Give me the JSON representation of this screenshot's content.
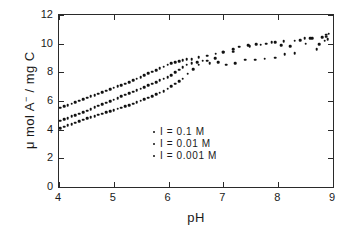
{
  "chart_data": {
    "type": "scatter",
    "title": "",
    "xlabel": "pH",
    "ylabel": "μ mol A− / mg C",
    "ylabel_parts": {
      "prefix": "μ mol  A",
      "superscript": "−",
      "suffix": " / mg C"
    },
    "xlim": [
      4,
      9
    ],
    "ylim": [
      0,
      12
    ],
    "xticks": [
      4,
      5,
      6,
      7,
      8,
      9
    ],
    "yticks": [
      0,
      2,
      4,
      6,
      8,
      10,
      12
    ],
    "xtick_labels": [
      "4",
      "5",
      "6",
      "7",
      "8",
      "9"
    ],
    "ytick_labels": [
      "0",
      "2",
      "4",
      "6",
      "8",
      "10",
      "12"
    ],
    "grid": false,
    "legend_position": "center-right-lower",
    "marker": "dot",
    "marker_color": "#111111",
    "frame_color": "#2a2a2a",
    "background": "#ffffff",
    "series": [
      {
        "name": "I = 0.1 M",
        "label": "I = 0.1 M",
        "ionic_strength": 0.1,
        "points": [
          [
            4.02,
            5.52
          ],
          [
            4.09,
            5.62
          ],
          [
            4.16,
            5.7
          ],
          [
            4.23,
            5.8
          ],
          [
            4.3,
            5.92
          ],
          [
            4.37,
            6.02
          ],
          [
            4.44,
            6.12
          ],
          [
            4.51,
            6.22
          ],
          [
            4.58,
            6.33
          ],
          [
            4.65,
            6.42
          ],
          [
            4.72,
            6.52
          ],
          [
            4.79,
            6.62
          ],
          [
            4.86,
            6.72
          ],
          [
            4.93,
            6.82
          ],
          [
            5.0,
            6.92
          ],
          [
            5.07,
            7.02
          ],
          [
            5.14,
            7.12
          ],
          [
            5.21,
            7.22
          ],
          [
            5.28,
            7.33
          ],
          [
            5.35,
            7.44
          ],
          [
            5.42,
            7.56
          ],
          [
            5.49,
            7.68
          ],
          [
            5.56,
            7.8
          ],
          [
            5.63,
            7.92
          ],
          [
            5.7,
            8.04
          ],
          [
            5.77,
            8.16
          ],
          [
            5.84,
            8.28
          ],
          [
            5.91,
            8.4
          ],
          [
            5.98,
            8.52
          ],
          [
            6.05,
            8.62
          ],
          [
            6.12,
            8.7
          ],
          [
            6.19,
            8.78
          ],
          [
            6.26,
            8.85
          ],
          [
            6.33,
            8.9
          ],
          [
            6.42,
            8.93
          ],
          [
            6.55,
            9.05
          ],
          [
            6.7,
            9.15
          ],
          [
            6.86,
            9.3
          ],
          [
            7.0,
            9.45
          ],
          [
            7.18,
            9.6
          ],
          [
            7.28,
            9.78
          ],
          [
            7.45,
            9.9
          ],
          [
            7.6,
            9.95
          ],
          [
            7.78,
            10.0
          ],
          [
            7.95,
            10.12
          ],
          [
            8.1,
            10.18
          ],
          [
            8.3,
            10.22
          ],
          [
            8.48,
            10.38
          ],
          [
            8.62,
            10.4
          ],
          [
            8.8,
            10.45
          ],
          [
            8.88,
            10.62
          ],
          [
            8.92,
            10.7
          ]
        ]
      },
      {
        "name": "I = 0.01 M",
        "label": "I = 0.01 M",
        "ionic_strength": 0.01,
        "points": [
          [
            4.02,
            4.62
          ],
          [
            4.09,
            4.72
          ],
          [
            4.16,
            4.82
          ],
          [
            4.23,
            4.92
          ],
          [
            4.3,
            5.02
          ],
          [
            4.37,
            5.12
          ],
          [
            4.44,
            5.22
          ],
          [
            4.51,
            5.33
          ],
          [
            4.58,
            5.44
          ],
          [
            4.65,
            5.55
          ],
          [
            4.72,
            5.66
          ],
          [
            4.79,
            5.77
          ],
          [
            4.86,
            5.88
          ],
          [
            4.93,
            5.99
          ],
          [
            5.0,
            6.1
          ],
          [
            5.07,
            6.21
          ],
          [
            5.14,
            6.32
          ],
          [
            5.21,
            6.43
          ],
          [
            5.28,
            6.54
          ],
          [
            5.35,
            6.65
          ],
          [
            5.42,
            6.76
          ],
          [
            5.49,
            6.87
          ],
          [
            5.56,
            6.98
          ],
          [
            5.63,
            7.09
          ],
          [
            5.7,
            7.2
          ],
          [
            5.77,
            7.32
          ],
          [
            5.84,
            7.44
          ],
          [
            5.91,
            7.56
          ],
          [
            5.98,
            7.68
          ],
          [
            6.05,
            7.82
          ],
          [
            6.12,
            8.0
          ],
          [
            6.19,
            8.18
          ],
          [
            6.26,
            8.35
          ],
          [
            6.33,
            8.52
          ],
          [
            6.42,
            8.62
          ],
          [
            6.52,
            8.72
          ],
          [
            6.62,
            8.8
          ],
          [
            6.75,
            8.62
          ],
          [
            6.9,
            8.7
          ],
          [
            7.05,
            8.52
          ],
          [
            7.22,
            8.62
          ],
          [
            7.4,
            8.88
          ],
          [
            7.58,
            8.88
          ],
          [
            7.75,
            8.95
          ],
          [
            7.95,
            9.02
          ],
          [
            8.12,
            9.28
          ],
          [
            8.3,
            9.32
          ],
          [
            8.5,
            10.0
          ],
          [
            8.7,
            9.6
          ],
          [
            8.85,
            10.22
          ],
          [
            8.9,
            10.3
          ]
        ]
      },
      {
        "name": "I = 0.001 M",
        "label": "I = 0.001 M",
        "ionic_strength": 0.001,
        "points": [
          [
            4.02,
            4.12
          ],
          [
            4.09,
            4.2
          ],
          [
            4.16,
            4.3
          ],
          [
            4.23,
            4.4
          ],
          [
            4.3,
            4.5
          ],
          [
            4.37,
            4.6
          ],
          [
            4.44,
            4.7
          ],
          [
            4.51,
            4.8
          ],
          [
            4.58,
            4.88
          ],
          [
            4.65,
            4.96
          ],
          [
            4.72,
            5.04
          ],
          [
            4.79,
            5.12
          ],
          [
            4.86,
            5.2
          ],
          [
            4.93,
            5.28
          ],
          [
            5.0,
            5.36
          ],
          [
            5.07,
            5.45
          ],
          [
            5.14,
            5.54
          ],
          [
            5.21,
            5.63
          ],
          [
            5.28,
            5.72
          ],
          [
            5.35,
            5.82
          ],
          [
            5.42,
            5.92
          ],
          [
            5.49,
            6.02
          ],
          [
            5.56,
            6.12
          ],
          [
            5.63,
            6.22
          ],
          [
            5.7,
            6.34
          ],
          [
            5.77,
            6.46
          ],
          [
            5.84,
            6.58
          ],
          [
            5.91,
            6.7
          ],
          [
            5.98,
            6.86
          ],
          [
            6.05,
            7.02
          ],
          [
            6.12,
            7.2
          ],
          [
            6.19,
            7.38
          ],
          [
            6.26,
            7.56
          ],
          [
            6.35,
            7.9
          ],
          [
            6.45,
            8.22
          ],
          [
            6.55,
            8.52
          ],
          [
            6.7,
            8.82
          ],
          [
            6.85,
            9.0
          ],
          [
            7.0,
            9.42
          ],
          [
            7.18,
            9.45
          ],
          [
            7.3,
            9.78
          ],
          [
            7.48,
            9.82
          ],
          [
            7.68,
            9.92
          ],
          [
            7.88,
            10.1
          ],
          [
            8.05,
            9.88
          ],
          [
            8.22,
            9.82
          ],
          [
            8.4,
            10.25
          ],
          [
            8.58,
            10.4
          ],
          [
            8.75,
            9.95
          ],
          [
            8.88,
            10.48
          ]
        ]
      }
    ]
  },
  "legend": {
    "items": [
      {
        "label": "I = 0.1 M"
      },
      {
        "label": "I = 0.01 M"
      },
      {
        "label": "I = 0.001 M"
      }
    ]
  },
  "axes": {
    "x_title": "pH",
    "y_title_prefix": "μ mol  A",
    "y_title_superscript": "−",
    "y_title_suffix": " / mg C"
  }
}
